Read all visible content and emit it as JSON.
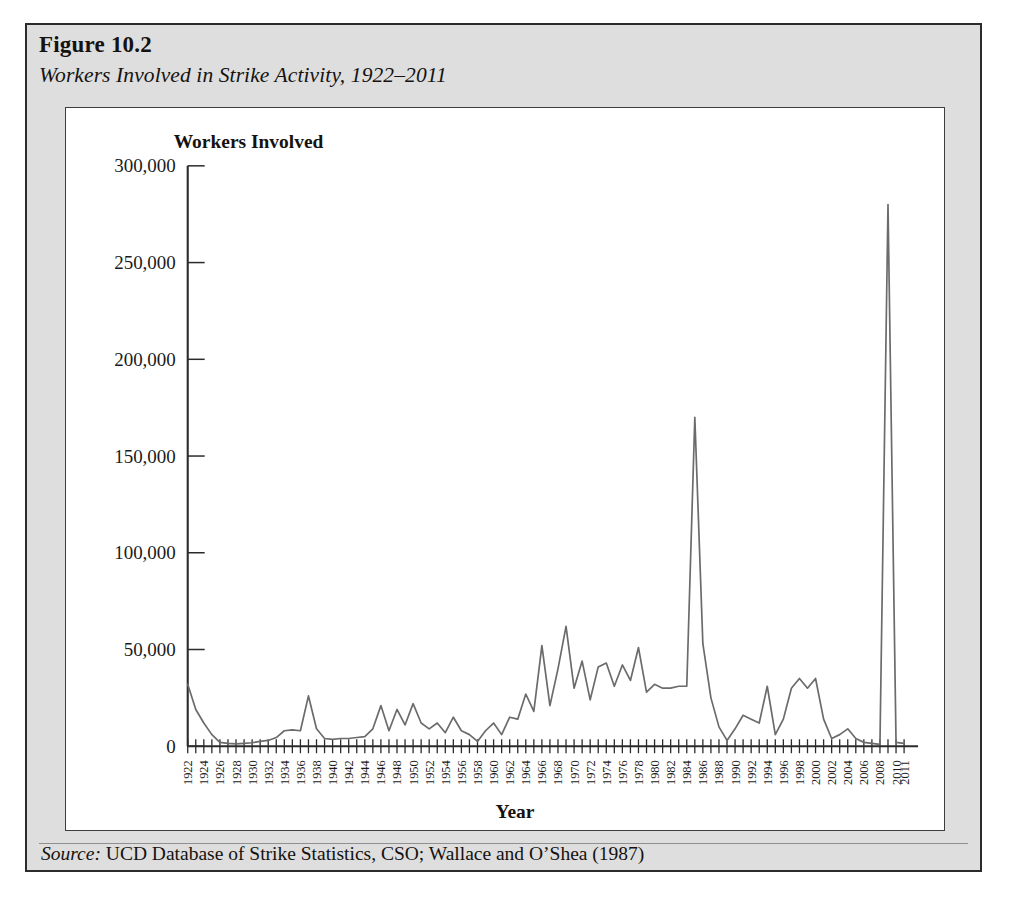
{
  "figure": {
    "number": "Figure 10.2",
    "subtitle": "Workers Involved in Strike Activity, 1922–2011",
    "source_label": "Source:",
    "source_text": "UCD Database of Strike Statistics, CSO; Wallace and O’Shea (1987)"
  },
  "style": {
    "frame_background": "#dedede",
    "frame_border": "#2b2b2b",
    "panel_background": "#ffffff",
    "line_color": "#6b6b6b",
    "axis_color": "#2b2b2b",
    "text_color": "#15120f"
  },
  "chart_data": {
    "type": "line",
    "title": "Workers Involved in Strike Activity, 1922–2011",
    "xlabel": "Year",
    "ylabel": "Workers Involved",
    "ylim": [
      0,
      300000
    ],
    "xlim": [
      1922,
      2011
    ],
    "grid": false,
    "legend": null,
    "ytick_values": [
      0,
      50000,
      100000,
      150000,
      200000,
      250000,
      300000
    ],
    "ytick_labels": [
      "0",
      "50,000",
      "100,000",
      "150,000",
      "200,000",
      "250,000",
      "300,000"
    ],
    "xtick_labels": [
      "1922",
      "1924",
      "1926",
      "1928",
      "1930",
      "1932",
      "1934",
      "1936",
      "1938",
      "1940",
      "1942",
      "1944",
      "1946",
      "1948",
      "1950",
      "1952",
      "1954",
      "1956",
      "1958",
      "1960",
      "1962",
      "1964",
      "1966",
      "1968",
      "1970",
      "1972",
      "1974",
      "1976",
      "1978",
      "1980",
      "1982",
      "1984",
      "1986",
      "1988",
      "1990",
      "1992",
      "1994",
      "1996",
      "1998",
      "2000",
      "2002",
      "2004",
      "2006",
      "2008",
      "2010",
      "2011"
    ],
    "series": [
      {
        "name": "Workers Involved",
        "x": [
          1922,
          1923,
          1924,
          1925,
          1926,
          1927,
          1928,
          1929,
          1930,
          1931,
          1932,
          1933,
          1934,
          1935,
          1936,
          1937,
          1938,
          1939,
          1940,
          1941,
          1942,
          1943,
          1944,
          1945,
          1946,
          1947,
          1948,
          1949,
          1950,
          1951,
          1952,
          1953,
          1954,
          1955,
          1956,
          1957,
          1958,
          1959,
          1960,
          1961,
          1962,
          1963,
          1964,
          1965,
          1966,
          1967,
          1968,
          1969,
          1970,
          1971,
          1972,
          1973,
          1974,
          1975,
          1976,
          1977,
          1978,
          1979,
          1980,
          1981,
          1982,
          1983,
          1984,
          1985,
          1986,
          1987,
          1988,
          1989,
          1990,
          1991,
          1992,
          1993,
          1994,
          1995,
          1996,
          1997,
          1998,
          1999,
          2000,
          2001,
          2002,
          2003,
          2004,
          2005,
          2006,
          2007,
          2008,
          2009,
          2010,
          2011
        ],
        "values": [
          32000,
          19000,
          12000,
          6000,
          2000,
          1500,
          1200,
          1500,
          1800,
          2500,
          3000,
          4500,
          8000,
          8500,
          8000,
          26000,
          9000,
          4000,
          3500,
          4000,
          4000,
          4500,
          5000,
          9000,
          21000,
          8000,
          19000,
          11000,
          22000,
          12000,
          9000,
          12000,
          7000,
          15000,
          8000,
          6000,
          2500,
          8000,
          12000,
          6000,
          15000,
          14000,
          27000,
          18000,
          52000,
          21000,
          40000,
          62000,
          30000,
          44000,
          24000,
          41000,
          43000,
          31000,
          42000,
          34000,
          51000,
          28000,
          32000,
          30000,
          30000,
          31000,
          31000,
          170000,
          53000,
          25000,
          10000,
          3000,
          9000,
          16000,
          14000,
          12000,
          31000,
          6000,
          14000,
          30000,
          35000,
          30000,
          35000,
          14000,
          4000,
          6000,
          9000,
          4000,
          2000,
          1500,
          1000,
          280000,
          2000,
          1500
        ]
      }
    ],
    "annotations": [
      {
        "label": "1985 peak",
        "x": 1985,
        "y": 170000
      },
      {
        "label": "2009 peak",
        "x": 2009,
        "y": 280000
      }
    ]
  }
}
